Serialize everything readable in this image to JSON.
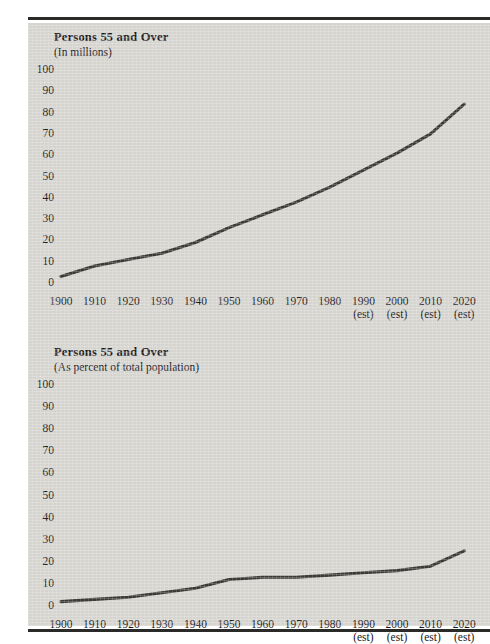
{
  "document": {
    "background_color": "#d6d4cf",
    "rule_color": "#2a2a28",
    "line_color": "#3a3936"
  },
  "charts": [
    {
      "id": "persons-55-and-over-millions",
      "title": "Persons 55 and Over",
      "subtitle": "(In millions)"
    },
    {
      "id": "persons-55-and-over-percent",
      "title": "Persons 55 and Over",
      "subtitle": "(As percent of total population)"
    }
  ],
  "chart_data": [
    {
      "type": "line",
      "title": "Persons 55 and Over",
      "subtitle": "(In millions)",
      "xlabel": "",
      "ylabel": "(In millions)",
      "categories": [
        "1900",
        "1910",
        "1920",
        "1930",
        "1940",
        "1950",
        "1960",
        "1970",
        "1980",
        "1990 (est)",
        "2000 (est)",
        "2010 (est)",
        "2020 (est)"
      ],
      "x": [
        1900,
        1910,
        1920,
        1930,
        1940,
        1950,
        1960,
        1970,
        1980,
        1990,
        2000,
        2010,
        2020
      ],
      "values": [
        3,
        8,
        11,
        14,
        19,
        26,
        32,
        38,
        45,
        53,
        61,
        70,
        84
      ],
      "ylim": [
        0,
        100
      ],
      "yticks": [
        0,
        10,
        20,
        30,
        40,
        50,
        60,
        70,
        80,
        90,
        100
      ],
      "grid": false,
      "legend": "none",
      "estimated_from": 1990
    },
    {
      "type": "line",
      "title": "Persons 55 and Over",
      "subtitle": "(As percent of total population)",
      "xlabel": "",
      "ylabel": "(As percent of total population)",
      "categories": [
        "1900",
        "1910",
        "1920",
        "1930",
        "1940",
        "1950",
        "1960",
        "1970",
        "1980",
        "1990 (est)",
        "2000 (est)",
        "2010 (est)",
        "2020 (est)"
      ],
      "x": [
        1900,
        1910,
        1920,
        1930,
        1940,
        1950,
        1960,
        1970,
        1980,
        1990,
        2000,
        2010,
        2020
      ],
      "values": [
        2,
        3,
        4,
        6,
        8,
        12,
        13,
        13,
        14,
        15,
        16,
        18,
        25
      ],
      "ylim": [
        0,
        100
      ],
      "yticks": [
        0,
        10,
        20,
        30,
        40,
        50,
        60,
        70,
        80,
        90,
        100
      ],
      "grid": false,
      "legend": "none",
      "estimated_from": 1990
    }
  ],
  "axis": {
    "yticks": [
      "100",
      "90",
      "80",
      "70",
      "60",
      "50",
      "40",
      "30",
      "20",
      "10",
      "0"
    ],
    "xticks": [
      {
        "year": "1900",
        "est": ""
      },
      {
        "year": "1910",
        "est": ""
      },
      {
        "year": "1920",
        "est": ""
      },
      {
        "year": "1930",
        "est": ""
      },
      {
        "year": "1940",
        "est": ""
      },
      {
        "year": "1950",
        "est": ""
      },
      {
        "year": "1960",
        "est": ""
      },
      {
        "year": "1970",
        "est": ""
      },
      {
        "year": "1980",
        "est": ""
      },
      {
        "year": "1990",
        "est": "(est)"
      },
      {
        "year": "2000",
        "est": "(est)"
      },
      {
        "year": "2010",
        "est": "(est)"
      },
      {
        "year": "2020",
        "est": "(est)"
      }
    ]
  }
}
